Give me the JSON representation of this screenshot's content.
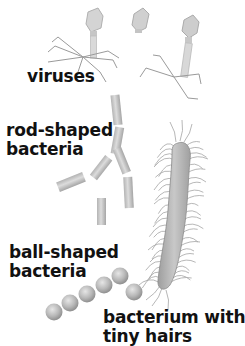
{
  "labels": {
    "viruses": "viruses",
    "rod_line1": "rod-shaped",
    "rod_line2": "bacteria",
    "ball_line1": "ball-shaped",
    "ball_line2": "bacteria",
    "hairs_line1": "bacterium with",
    "hairs_line2": "tiny hairs"
  },
  "colors": {
    "text": "#111111",
    "organism_gray": "#a8a8a8",
    "organism_light": "#d6d6d6",
    "hair": "#9a9a9a"
  }
}
